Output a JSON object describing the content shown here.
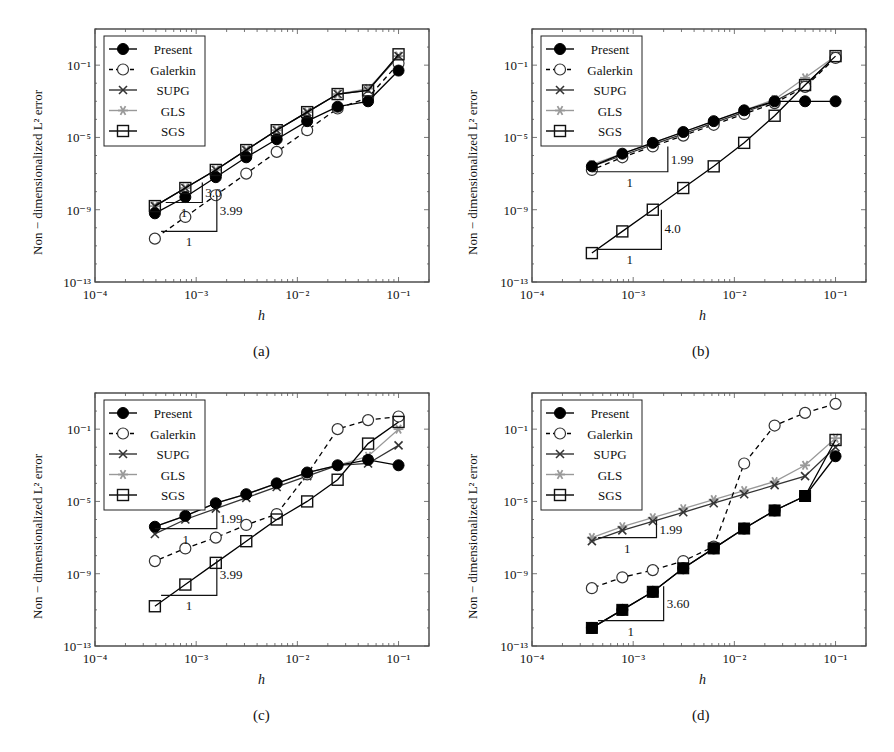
{
  "figure": {
    "panels": [
      "a",
      "b",
      "c",
      "d"
    ]
  },
  "chart_data": [
    {
      "id": "a",
      "type": "line",
      "caption": "(a)",
      "xlabel": "h",
      "ylabel": "Non − dimensionalized L² error",
      "xscale": "log",
      "yscale": "log",
      "xlim": [
        0.0001,
        0.2
      ],
      "ylim": [
        1e-13,
        10
      ],
      "xticks": [
        "10⁻⁴",
        "10⁻³",
        "10⁻²",
        "10⁻¹"
      ],
      "yticks": [
        "10⁻¹³",
        "10⁻⁹",
        "10⁻⁵",
        "10⁻¹"
      ],
      "legend_position": "upper left",
      "x": [
        0.1,
        0.05,
        0.025,
        0.0125,
        0.00625,
        0.003125,
        0.0015625,
        0.00078125,
        0.000390625
      ],
      "series_log10": [
        {
          "name": "Present",
          "values": [
            -1.3,
            -3.0,
            -3.3,
            -4.1,
            -5.1,
            -6.1,
            -7.2,
            -8.3,
            -9.2
          ]
        },
        {
          "name": "Galerkin",
          "values": [
            -0.9,
            -2.8,
            -3.4,
            -4.6,
            -5.8,
            -7.0,
            -8.2,
            -9.4,
            -10.6
          ]
        },
        {
          "name": "SUPG",
          "values": [
            -0.5,
            -2.4,
            -2.6,
            -3.6,
            -4.6,
            -5.7,
            -6.8,
            -7.8,
            -8.8
          ]
        },
        {
          "name": "GLS",
          "values": [
            -0.5,
            -2.3,
            -2.6,
            -3.6,
            -4.6,
            -5.7,
            -6.8,
            -7.8,
            -8.8
          ]
        },
        {
          "name": "SGS",
          "values": [
            -0.4,
            -2.4,
            -2.6,
            -3.6,
            -4.6,
            -5.7,
            -6.8,
            -7.8,
            -8.8
          ]
        }
      ],
      "annotations": [
        {
          "text": "3.0",
          "type": "slope",
          "run_label": "1"
        },
        {
          "text": "3.99",
          "type": "slope",
          "run_label": "1"
        }
      ]
    },
    {
      "id": "b",
      "type": "line",
      "caption": "(b)",
      "xlabel": "h",
      "ylabel": "Non − dimensionalized L² error",
      "xscale": "log",
      "yscale": "log",
      "xlim": [
        0.0001,
        0.2
      ],
      "ylim": [
        1e-13,
        10
      ],
      "xticks": [
        "10⁻⁴",
        "10⁻³",
        "10⁻²",
        "10⁻¹"
      ],
      "yticks": [
        "10⁻¹³",
        "10⁻⁹",
        "10⁻⁵",
        "10⁻¹"
      ],
      "legend_position": "upper left",
      "x": [
        0.1,
        0.05,
        0.025,
        0.0125,
        0.00625,
        0.003125,
        0.0015625,
        0.00078125,
        0.000390625
      ],
      "series_log10": [
        {
          "name": "Present",
          "values": [
            -3.0,
            -3.0,
            -3.0,
            -3.5,
            -4.1,
            -4.7,
            -5.3,
            -5.9,
            -6.6
          ]
        },
        {
          "name": "Galerkin",
          "values": [
            -0.6,
            -2.2,
            -3.1,
            -3.7,
            -4.3,
            -4.9,
            -5.5,
            -6.1,
            -6.8
          ]
        },
        {
          "name": "SUPG",
          "values": [
            -0.5,
            -2.1,
            -3.0,
            -3.6,
            -4.2,
            -4.8,
            -5.4,
            -6.0,
            -6.6
          ]
        },
        {
          "name": "GLS",
          "values": [
            -0.5,
            -1.7,
            -2.9,
            -3.5,
            -4.1,
            -4.7,
            -5.3,
            -5.9,
            -6.5
          ]
        },
        {
          "name": "SGS",
          "values": [
            -0.5,
            -2.1,
            -3.8,
            -5.3,
            -6.6,
            -7.8,
            -9.0,
            -10.2,
            -11.4
          ]
        }
      ],
      "annotations": [
        {
          "text": "1.99",
          "type": "slope",
          "run_label": "1"
        },
        {
          "text": "4.0",
          "type": "slope",
          "run_label": "1"
        }
      ]
    },
    {
      "id": "c",
      "type": "line",
      "caption": "(c)",
      "xlabel": "h",
      "ylabel": "Non − dimensionalized L² error",
      "xscale": "log",
      "yscale": "log",
      "xlim": [
        0.0001,
        0.2
      ],
      "ylim": [
        1e-13,
        10
      ],
      "xticks": [
        "10⁻⁴",
        "10⁻³",
        "10⁻²",
        "10⁻¹"
      ],
      "yticks": [
        "10⁻¹³",
        "10⁻⁹",
        "10⁻⁵",
        "10⁻¹"
      ],
      "legend_position": "upper left",
      "x": [
        0.1,
        0.05,
        0.025,
        0.0125,
        0.00625,
        0.003125,
        0.0015625,
        0.00078125,
        0.000390625
      ],
      "series_log10": [
        {
          "name": "Present",
          "values": [
            -3.0,
            -2.7,
            -3.0,
            -3.4,
            -4.0,
            -4.6,
            -5.1,
            -5.8,
            -6.4
          ]
        },
        {
          "name": "Galerkin",
          "values": [
            -0.3,
            -0.5,
            -1.0,
            -3.5,
            -5.7,
            -6.3,
            -7.0,
            -7.6,
            -8.3
          ]
        },
        {
          "name": "SUPG",
          "values": [
            -1.9,
            -2.9,
            -3.0,
            -3.6,
            -4.2,
            -4.8,
            -5.4,
            -6.0,
            -6.8
          ]
        },
        {
          "name": "GLS",
          "values": [
            -1.0,
            -2.5,
            -3.0,
            -3.4,
            -4.0,
            -4.6,
            -5.1,
            -5.8,
            -6.4
          ]
        },
        {
          "name": "SGS",
          "values": [
            -0.6,
            -1.8,
            -3.8,
            -5.0,
            -6.0,
            -7.2,
            -8.4,
            -9.6,
            -10.8
          ]
        }
      ],
      "annotations": [
        {
          "text": "1.99",
          "type": "slope",
          "run_label": "1"
        },
        {
          "text": "3.99",
          "type": "slope",
          "run_label": "1"
        }
      ]
    },
    {
      "id": "d",
      "type": "line",
      "caption": "(d)",
      "xlabel": "h",
      "ylabel": "Non − dimensionalized L² error",
      "xscale": "log",
      "yscale": "log",
      "xlim": [
        0.0001,
        0.2
      ],
      "ylim": [
        1e-13,
        10
      ],
      "xticks": [
        "10⁻⁴",
        "10⁻³",
        "10⁻²",
        "10⁻¹"
      ],
      "yticks": [
        "10⁻¹³",
        "10⁻⁹",
        "10⁻⁵",
        "10⁻¹"
      ],
      "legend_position": "upper left",
      "x": [
        0.1,
        0.05,
        0.025,
        0.0125,
        0.00625,
        0.003125,
        0.0015625,
        0.00078125,
        0.000390625
      ],
      "series_log10": [
        {
          "name": "Present",
          "values": [
            -2.5,
            -4.7,
            -5.5,
            -6.5,
            -7.6,
            -8.7,
            -10.0,
            -11.0,
            -12.0
          ]
        },
        {
          "name": "Galerkin",
          "values": [
            0.4,
            -0.1,
            -0.8,
            -2.9,
            -7.5,
            -8.3,
            -8.8,
            -9.2,
            -9.8
          ]
        },
        {
          "name": "SUPG",
          "values": [
            -2.0,
            -3.6,
            -4.1,
            -4.6,
            -5.1,
            -5.6,
            -6.1,
            -6.6,
            -7.2
          ]
        },
        {
          "name": "GLS",
          "values": [
            -1.5,
            -3.0,
            -3.9,
            -4.4,
            -4.9,
            -5.4,
            -5.9,
            -6.4,
            -7.0
          ]
        },
        {
          "name": "SGS",
          "values": [
            -1.6,
            -4.7,
            -5.5,
            -6.5,
            -7.6,
            -8.7,
            -10.0,
            -11.0,
            -12.0
          ]
        }
      ],
      "annotations": [
        {
          "text": "1.99",
          "type": "slope",
          "run_label": "1"
        },
        {
          "text": "3.60",
          "type": "slope",
          "run_label": "1"
        }
      ]
    }
  ],
  "legend": [
    {
      "name": "Present",
      "marker": "filled-circle",
      "line": "solid",
      "color": "#000000"
    },
    {
      "name": "Galerkin",
      "marker": "open-circle",
      "line": "dashed",
      "color": "#000000"
    },
    {
      "name": "SUPG",
      "marker": "cross",
      "line": "solid",
      "color": "#333333"
    },
    {
      "name": "GLS",
      "marker": "star",
      "line": "solid",
      "color": "#999999"
    },
    {
      "name": "SGS",
      "marker": "open-square",
      "line": "solid",
      "color": "#000000"
    }
  ],
  "labels": {
    "xlabel": "h",
    "ylabel": "Non − dimensionalized L² error",
    "xticks": [
      "10⁻⁴",
      "10⁻³",
      "10⁻²",
      "10⁻¹"
    ],
    "yticks": [
      "10⁻¹³",
      "10⁻⁹",
      "10⁻⁵",
      "10⁻¹"
    ]
  },
  "slopes": {
    "a": [
      {
        "rise": "3.0",
        "run": "1",
        "x0": 0.0005,
        "x1": 0.00115,
        "yTop": -7.5,
        "yBase": -8.6,
        "labelX": 0.00115,
        "labelY": -8.0,
        "runLabelY": -8.6
      },
      {
        "rise": "3.99",
        "run": "1",
        "x0": 0.00045,
        "x1": 0.0016,
        "yTop": -8.2,
        "yBase": -10.2,
        "labelX": 0.0016,
        "labelY": -9.0,
        "runLabelY": -10.2
      }
    ],
    "b": [
      {
        "rise": "1.99",
        "run": "1",
        "x0": 0.00039,
        "x1": 0.0022,
        "yTop": -5.5,
        "yBase": -6.9,
        "labelX": 0.0022,
        "labelY": -6.2,
        "runLabelY": -6.9
      },
      {
        "rise": "4.0",
        "run": "1",
        "x0": 0.00045,
        "x1": 0.0019,
        "yTop": -9.0,
        "yBase": -11.2,
        "labelX": 0.0019,
        "labelY": -10.0,
        "runLabelY": -11.2
      }
    ],
    "c": [
      {
        "rise": "1.99",
        "run": "1",
        "x0": 0.00039,
        "x1": 0.0016,
        "yTop": -5.3,
        "yBase": -6.5,
        "labelX": 0.0016,
        "labelY": -5.9,
        "runLabelY": -6.5
      },
      {
        "rise": "3.99",
        "run": "1",
        "x0": 0.00045,
        "x1": 0.0016,
        "yTop": -8.2,
        "yBase": -10.2,
        "labelX": 0.0016,
        "labelY": -9.0,
        "runLabelY": -10.2
      }
    ],
    "d": [
      {
        "rise": "1.99",
        "run": "1",
        "x0": 0.00045,
        "x1": 0.0017,
        "yTop": -6.0,
        "yBase": -7.0,
        "labelX": 0.0017,
        "labelY": -6.5,
        "runLabelY": -7.0
      },
      {
        "rise": "3.60",
        "run": "1",
        "x0": 0.00045,
        "x1": 0.002,
        "yTop": -9.7,
        "yBase": -11.6,
        "labelX": 0.002,
        "labelY": -10.6,
        "runLabelY": -11.6
      }
    ]
  }
}
